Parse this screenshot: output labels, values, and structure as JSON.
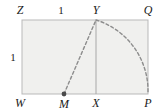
{
  "figure": {
    "canvas": {
      "width": 161,
      "height": 111
    },
    "background_color": "#ffffff",
    "rectangle": {
      "fill_color": "#f0f0ee",
      "stroke_color": "#b9b9b9",
      "left": 22,
      "top": 20,
      "right": 148,
      "bottom": 94
    },
    "segment_color": "#9a9a9a",
    "dash_color": "#8d8d8d",
    "point_color": "#4a4a4a",
    "vertices": [
      {
        "name": "Z",
        "label": "Z",
        "x": 20,
        "y": 10,
        "corner": "top-left"
      },
      {
        "name": "Y",
        "label": "Y",
        "x": 96,
        "y": 10,
        "corner": "top-middle"
      },
      {
        "name": "Q",
        "label": "Q",
        "x": 148,
        "y": 10,
        "corner": "top-right"
      },
      {
        "name": "W",
        "label": "W",
        "x": 20,
        "y": 103,
        "corner": "bottom-left"
      },
      {
        "name": "M",
        "label": "M",
        "x": 64,
        "y": 104,
        "corner": "bottom-mid-left"
      },
      {
        "name": "X",
        "label": "X",
        "x": 96,
        "y": 103,
        "corner": "bottom-middle"
      },
      {
        "name": "P",
        "label": "P",
        "x": 148,
        "y": 103,
        "corner": "bottom-right"
      }
    ],
    "measures": [
      {
        "name": "top-length",
        "label": "1",
        "x": 61,
        "y": 10
      },
      {
        "name": "left-height",
        "label": "1",
        "x": 13,
        "y": 57
      }
    ],
    "points": [
      {
        "name": "M",
        "x": 64,
        "y": 94,
        "radius": 2.4
      }
    ],
    "lines": [
      {
        "name": "segment-XY",
        "x1": 96,
        "y1": 20,
        "x2": 96,
        "y2": 94,
        "style": "solid"
      }
    ],
    "dashed_paths": [
      {
        "name": "segment-MY",
        "type": "line",
        "x1": 64,
        "y1": 94,
        "x2": 96,
        "y2": 20
      },
      {
        "name": "arc-YP",
        "type": "arc",
        "cx": 96,
        "cy": 94,
        "r": 74,
        "from_x": 96,
        "from_y": 20,
        "to_x": 148,
        "to_y": 92
      }
    ]
  }
}
